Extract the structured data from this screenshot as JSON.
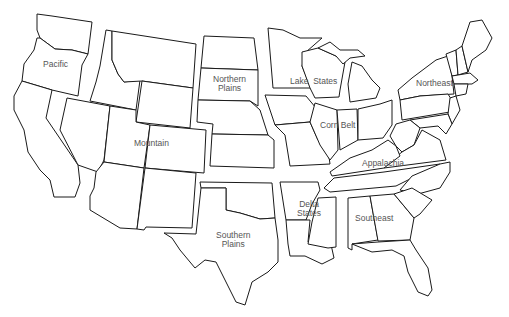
{
  "map": {
    "title": "U.S. Farm Production Regions",
    "line_color": "#1a1a1a",
    "label_color": "#555555",
    "background": "#ffffff",
    "regions": [
      {
        "name": "Pacific",
        "label_line1": "Pacific",
        "label_line2": ""
      },
      {
        "name": "Mountain",
        "label_line1": "Mountain",
        "label_line2": ""
      },
      {
        "name": "Northern Plains",
        "label_line1": "Northern",
        "label_line2": "Plains"
      },
      {
        "name": "Southern Plains",
        "label_line1": "Southern",
        "label_line2": "Plains"
      },
      {
        "name": "Lake States",
        "label_line1": "Lake  States",
        "label_line2": ""
      },
      {
        "name": "Corn Belt",
        "label_line1": "Corn Belt",
        "label_line2": ""
      },
      {
        "name": "Delta States",
        "label_line1": "Delta",
        "label_line2": "States"
      },
      {
        "name": "Northeast",
        "label_line1": "Northeast",
        "label_line2": ""
      },
      {
        "name": "Appalachia",
        "label_line1": "Appalachia",
        "label_line2": ""
      },
      {
        "name": "Southeast",
        "label_line1": "Southeast",
        "label_line2": ""
      }
    ]
  }
}
